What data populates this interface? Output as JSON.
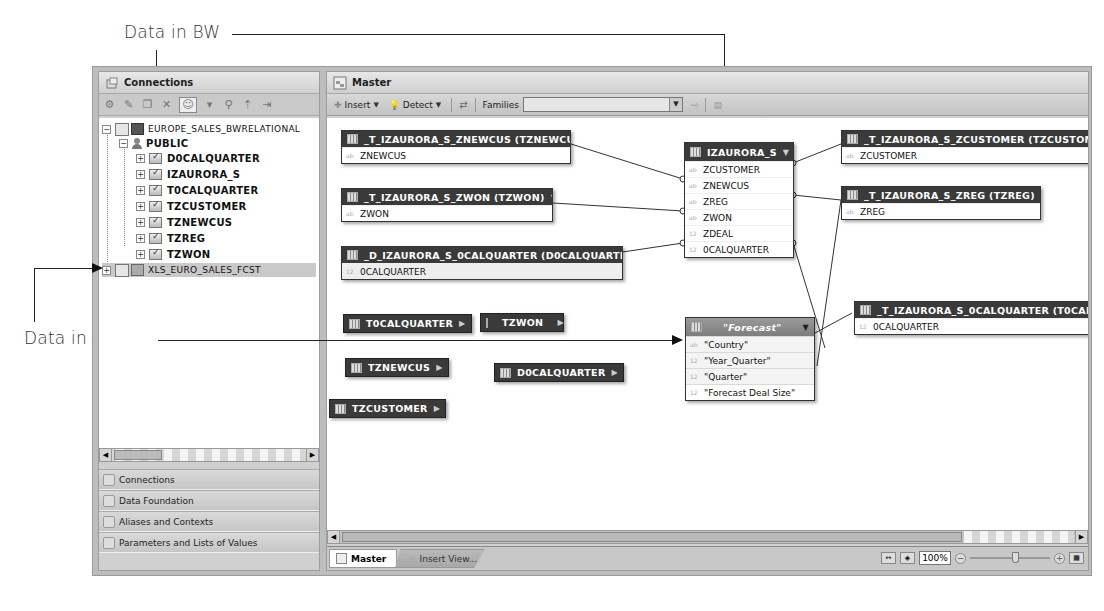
{
  "annotations": {
    "bw_label": "Data in BW",
    "excel_label": "Data in Excel"
  },
  "left_panel": {
    "title": "Connections",
    "toolbar_icons": [
      "new-connection-icon",
      "edit-icon",
      "copy-icon",
      "delete-icon",
      "user-filter-icon",
      "dropdown-icon",
      "find-icon",
      "collapse-icon",
      "export-icon"
    ],
    "tree": {
      "root": "EUROPE_SALES_BWRELATIONAL",
      "schema": "PUBLIC",
      "tables": [
        "D0CALQUARTER",
        "IZAURORA_S",
        "T0CALQUARTER",
        "TZCUSTOMER",
        "TZNEWCUS",
        "TZREG",
        "TZWON"
      ],
      "second_root": "XLS_EURO_SALES_FCST"
    },
    "nav": [
      {
        "label": "Connections",
        "icon": "connections-icon"
      },
      {
        "label": "Data Foundation",
        "icon": "data-foundation-icon"
      },
      {
        "label": "Aliases and Contexts",
        "icon": "aliases-icon"
      },
      {
        "label": "Parameters and Lists of Values",
        "icon": "parameters-icon"
      }
    ]
  },
  "main_panel": {
    "title": "Master",
    "toolbar": {
      "insert_label": "Insert",
      "detect_label": "Detect",
      "families_label": "Families",
      "families_value": ""
    },
    "tables": {
      "znewcus": {
        "title": "_T_IZAURORA_S_ZNEWCUS (TZNEWCUS)",
        "columns": [
          {
            "type": "ab",
            "name": "ZNEWCUS"
          }
        ]
      },
      "zwon": {
        "title": "_T_IZAURORA_S_ZWON (TZWON)",
        "columns": [
          {
            "type": "ab",
            "name": "ZWON"
          }
        ]
      },
      "d0calquarter": {
        "title": "_D_IZAURORA_S_0CALQUARTER (D0CALQUARTER)",
        "columns": [
          {
            "type": "12",
            "name": "0CALQUARTER"
          }
        ]
      },
      "izaurora": {
        "title": "IZAURORA_S",
        "columns": [
          {
            "type": "ab",
            "name": "ZCUSTOMER"
          },
          {
            "type": "ab",
            "name": "ZNEWCUS"
          },
          {
            "type": "ab",
            "name": "ZREG"
          },
          {
            "type": "ab",
            "name": "ZWON"
          },
          {
            "type": "12",
            "name": "ZDEAL"
          },
          {
            "type": "12",
            "name": "0CALQUARTER"
          }
        ]
      },
      "zcustomer": {
        "title": "_T_IZAURORA_S_ZCUSTOMER (TZCUSTOMER)",
        "columns": [
          {
            "type": "ab",
            "name": "ZCUSTOMER"
          }
        ]
      },
      "zreg": {
        "title": "_T_IZAURORA_S_ZREG (TZREG)",
        "columns": [
          {
            "type": "ab",
            "name": "ZREG"
          }
        ]
      },
      "t0calquarter": {
        "title": "_T_IZAURORA_S_0CALQUARTER (T0CALQUARTER)",
        "columns": [
          {
            "type": "12",
            "name": "0CALQUARTER"
          }
        ]
      },
      "forecast": {
        "title": "\"Forecast\"",
        "columns": [
          {
            "type": "ab",
            "name": "\"Country\""
          },
          {
            "type": "12",
            "name": "\"Year_Quarter\""
          },
          {
            "type": "12",
            "name": "\"Quarter\""
          },
          {
            "type": "12",
            "name": "\"Forecast Deal Size\""
          }
        ]
      }
    },
    "collapsed_tables": [
      "T0CALQUARTER",
      "TZWON",
      "TZNEWCUS",
      "D0CALQUARTER",
      "TZCUSTOMER"
    ],
    "tabs": [
      {
        "label": "Master",
        "active": true
      },
      {
        "label": "Insert View...",
        "active": false
      }
    ],
    "zoom_value": "100%"
  }
}
